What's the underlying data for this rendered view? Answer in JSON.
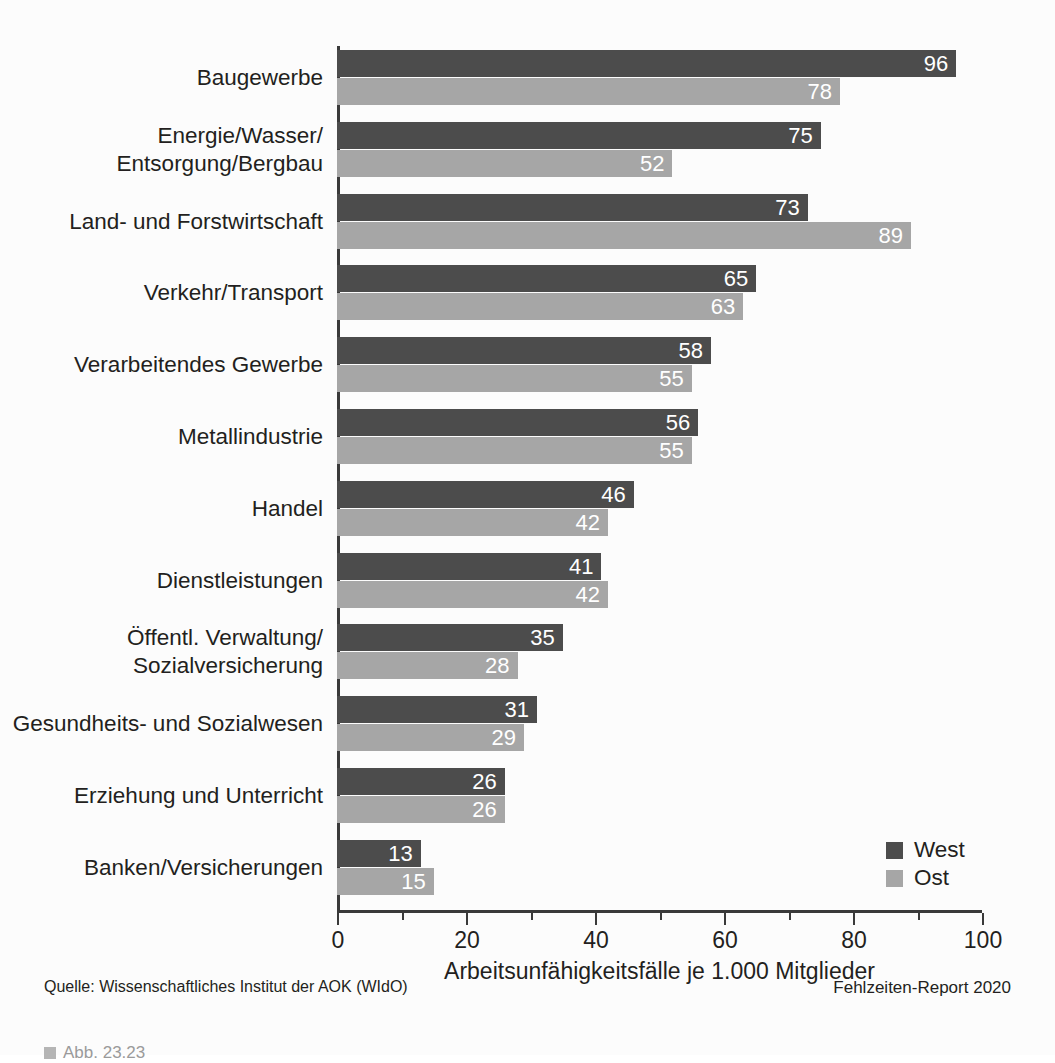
{
  "chart_data": {
    "type": "bar",
    "orientation": "horizontal",
    "title": "",
    "xlabel": "Arbeitsunfähigkeitsfälle je 1.000 Mitglieder",
    "ylabel": "",
    "xlim": [
      0,
      100
    ],
    "xticks": [
      0,
      20,
      40,
      60,
      80,
      100
    ],
    "xtick_labels": [
      "0",
      "20",
      "40",
      "60",
      "80",
      "100"
    ],
    "minor_xticks": [
      10,
      30,
      50,
      70,
      90
    ],
    "grid": false,
    "legend_position": "bottom-right",
    "categories": [
      "Baugewerbe",
      "Energie/Wasser/\nEntsorgung/Bergbau",
      "Land- und Forstwirtschaft",
      "Verkehr/Transport",
      "Verarbeitendes Gewerbe",
      "Metallindustrie",
      "Handel",
      "Dienstleistungen",
      "Öffentl. Verwaltung/\nSozialversicherung",
      "Gesundheits- und Sozialwesen",
      "Erziehung und Unterricht",
      "Banken/Versicherungen"
    ],
    "series": [
      {
        "name": "West",
        "color": "#4c4c4c",
        "values": [
          96,
          75,
          73,
          65,
          58,
          56,
          46,
          41,
          35,
          31,
          26,
          13
        ]
      },
      {
        "name": "Ost",
        "color": "#a6a6a6",
        "values": [
          78,
          52,
          89,
          63,
          55,
          55,
          42,
          42,
          28,
          29,
          26,
          15
        ]
      }
    ]
  },
  "legend": {
    "items": [
      {
        "label": "West",
        "color": "#4c4c4c"
      },
      {
        "label": "Ost",
        "color": "#a6a6a6"
      }
    ]
  },
  "footer": {
    "source": "Quelle: Wissenschaftliches Institut der AOK (WIdO)",
    "report": "Fehlzeiten-Report 2020",
    "caption": "Abb. 23.23"
  },
  "colors": {
    "west": "#4c4c4c",
    "ost": "#a6a6a6",
    "axis": "#3a3a3a",
    "text": "#231f20",
    "background": "#fcfcfc"
  }
}
